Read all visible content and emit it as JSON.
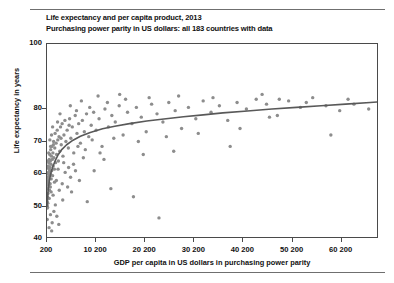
{
  "chart_data": {
    "type": "scatter",
    "title": "Life expectancy and per capita product, 2013",
    "subtitle": "Purchasing power parity in US dollars: all 183 countries with data",
    "xlabel": "GDP per capita in US dollars in purchasing power parity",
    "ylabel": "Life expectancy in years",
    "xlim": [
      200,
      67800
    ],
    "ylim": [
      40,
      100
    ],
    "grid": false,
    "legend": null,
    "n_countries": 183,
    "point_color": "#8d8d8d",
    "trend_color": "#595959",
    "axis_color": "#4a4a4a",
    "xticks": [
      {
        "value": 200,
        "label": "200"
      },
      {
        "value": 10200,
        "label": "10 200"
      },
      {
        "value": 20200,
        "label": "20 200"
      },
      {
        "value": 30200,
        "label": "30 200"
      },
      {
        "value": 40200,
        "label": "40 200"
      },
      {
        "value": 50200,
        "label": "50 200"
      },
      {
        "value": 60200,
        "label": "60 200"
      }
    ],
    "yticks": [
      {
        "value": 100,
        "label": "100"
      },
      {
        "value": 80,
        "label": "80"
      },
      {
        "value": 70,
        "label": "70"
      },
      {
        "value": 60,
        "label": "60"
      },
      {
        "value": 50,
        "label": "50"
      },
      {
        "value": 40,
        "label": "40"
      }
    ],
    "trend_line": {
      "description": "logarithmic best fit of life expectancy versus GDP per capita",
      "points": [
        [
          200,
          50.0
        ],
        [
          400,
          54.5
        ],
        [
          700,
          58.2
        ],
        [
          1000,
          60.4
        ],
        [
          1400,
          62.3
        ],
        [
          1900,
          64.2
        ],
        [
          2500,
          66.0
        ],
        [
          3200,
          67.5
        ],
        [
          4200,
          69.0
        ],
        [
          5500,
          70.4
        ],
        [
          7000,
          71.6
        ],
        [
          9000,
          72.8
        ],
        [
          11500,
          73.9
        ],
        [
          14000,
          74.7
        ],
        [
          17000,
          75.5
        ],
        [
          20500,
          76.3
        ],
        [
          24000,
          76.9
        ],
        [
          28000,
          77.6
        ],
        [
          32000,
          78.2
        ],
        [
          36000,
          78.8
        ],
        [
          41000,
          79.4
        ],
        [
          46000,
          80.0
        ],
        [
          51000,
          80.5
        ],
        [
          56000,
          81.0
        ],
        [
          61000,
          81.5
        ],
        [
          66000,
          82.0
        ],
        [
          67800,
          82.2
        ]
      ]
    },
    "points": [
      [
        220,
        49.5
      ],
      [
        230,
        51.5
      ],
      [
        250,
        50.2
      ],
      [
        280,
        53.0
      ],
      [
        300,
        49.8
      ],
      [
        330,
        55.5
      ],
      [
        350,
        51.0
      ],
      [
        380,
        57.5
      ],
      [
        400,
        54.0
      ],
      [
        420,
        59.0
      ],
      [
        450,
        58.0
      ],
      [
        470,
        62.5
      ],
      [
        500,
        56.5
      ],
      [
        520,
        60.5
      ],
      [
        560,
        63.5
      ],
      [
        600,
        58.5
      ],
      [
        630,
        61.5
      ],
      [
        660,
        64.5
      ],
      [
        700,
        55.0
      ],
      [
        720,
        59.5
      ],
      [
        760,
        66.0
      ],
      [
        800,
        62.0
      ],
      [
        840,
        57.0
      ],
      [
        880,
        64.0
      ],
      [
        920,
        60.0
      ],
      [
        960,
        67.5
      ],
      [
        1000,
        63.0
      ],
      [
        1050,
        58.5
      ],
      [
        1100,
        65.5
      ],
      [
        1150,
        61.0
      ],
      [
        1200,
        68.5
      ],
      [
        1280,
        64.5
      ],
      [
        1340,
        59.5
      ],
      [
        1400,
        66.5
      ],
      [
        1460,
        62.5
      ],
      [
        1540,
        70.0
      ],
      [
        1600,
        65.0
      ],
      [
        1700,
        61.5
      ],
      [
        1780,
        68.0
      ],
      [
        1850,
        72.5
      ],
      [
        1950,
        63.5
      ],
      [
        2050,
        69.5
      ],
      [
        2150,
        66.0
      ],
      [
        2280,
        73.5
      ],
      [
        2400,
        70.5
      ],
      [
        2520,
        64.0
      ],
      [
        2650,
        71.5
      ],
      [
        2800,
        67.0
      ],
      [
        2950,
        74.5
      ],
      [
        3100,
        69.0
      ],
      [
        3280,
        75.5
      ],
      [
        3450,
        65.5
      ],
      [
        3650,
        72.0
      ],
      [
        3850,
        76.5
      ],
      [
        4050,
        70.0
      ],
      [
        4300,
        73.5
      ],
      [
        4550,
        68.0
      ],
      [
        4800,
        77.0
      ],
      [
        5050,
        71.0
      ],
      [
        5350,
        74.5
      ],
      [
        5650,
        66.5
      ],
      [
        5950,
        78.0
      ],
      [
        6300,
        72.5
      ],
      [
        6650,
        75.5
      ],
      [
        7000,
        69.5
      ],
      [
        7400,
        76.5
      ],
      [
        7800,
        73.0
      ],
      [
        8250,
        78.5
      ],
      [
        8700,
        71.5
      ],
      [
        9200,
        75.0
      ],
      [
        9700,
        79.0
      ],
      [
        10200,
        73.5
      ],
      [
        10800,
        77.0
      ],
      [
        11400,
        68.5
      ],
      [
        12000,
        80.0
      ],
      [
        12700,
        74.5
      ],
      [
        13400,
        78.0
      ],
      [
        14100,
        76.0
      ],
      [
        14900,
        81.0
      ],
      [
        15700,
        72.0
      ],
      [
        16600,
        79.0
      ],
      [
        17500,
        75.5
      ],
      [
        18400,
        80.5
      ],
      [
        19400,
        77.5
      ],
      [
        20400,
        73.0
      ],
      [
        21500,
        81.5
      ],
      [
        22600,
        78.5
      ],
      [
        23800,
        76.0
      ],
      [
        25000,
        82.0
      ],
      [
        26300,
        79.5
      ],
      [
        27600,
        74.0
      ],
      [
        29000,
        80.5
      ],
      [
        30500,
        77.0
      ],
      [
        32000,
        82.5
      ],
      [
        33600,
        79.0
      ],
      [
        35300,
        81.0
      ],
      [
        37000,
        76.5
      ],
      [
        38900,
        82.0
      ],
      [
        40800,
        80.0
      ],
      [
        42800,
        83.0
      ],
      [
        44900,
        81.5
      ],
      [
        47100,
        78.0
      ],
      [
        49400,
        82.5
      ],
      [
        51800,
        80.5
      ],
      [
        54300,
        83.5
      ],
      [
        57000,
        81.0
      ],
      [
        59800,
        79.5
      ],
      [
        62700,
        81.5
      ],
      [
        65700,
        80.0
      ],
      [
        1250,
        45.0
      ],
      [
        2200,
        47.0
      ],
      [
        3400,
        52.0
      ],
      [
        5200,
        54.5
      ],
      [
        8400,
        51.5
      ],
      [
        13200,
        55.5
      ],
      [
        17800,
        53.0
      ],
      [
        23000,
        46.5
      ],
      [
        1600,
        48.5
      ],
      [
        900,
        47.5
      ],
      [
        650,
        52.5
      ],
      [
        1900,
        50.5
      ],
      [
        4400,
        56.0
      ],
      [
        6800,
        58.0
      ],
      [
        9800,
        61.0
      ],
      [
        2700,
        55.0
      ],
      [
        3900,
        60.5
      ],
      [
        5600,
        63.0
      ],
      [
        7600,
        65.0
      ],
      [
        11000,
        66.5
      ],
      [
        780,
        70.5
      ],
      [
        1120,
        72.0
      ],
      [
        1500,
        69.0
      ],
      [
        2350,
        76.0
      ],
      [
        3050,
        71.0
      ],
      [
        4700,
        75.0
      ],
      [
        6200,
        79.5
      ],
      [
        8900,
        80.5
      ],
      [
        12500,
        82.0
      ],
      [
        16200,
        83.0
      ],
      [
        550,
        66.5
      ],
      [
        940,
        68.5
      ],
      [
        1340,
        74.5
      ],
      [
        2850,
        78.5
      ],
      [
        4950,
        81.0
      ],
      [
        7200,
        82.5
      ],
      [
        10600,
        84.0
      ],
      [
        15000,
        84.5
      ],
      [
        21000,
        83.5
      ],
      [
        27000,
        84.0
      ],
      [
        34000,
        83.5
      ],
      [
        44000,
        84.5
      ],
      [
        47500,
        83.0
      ],
      [
        53000,
        82.0
      ],
      [
        61500,
        83.0
      ],
      [
        320,
        62.0
      ],
      [
        480,
        64.0
      ],
      [
        880,
        56.0
      ],
      [
        1720,
        57.5
      ],
      [
        2450,
        61.5
      ],
      [
        3600,
        63.5
      ],
      [
        5000,
        59.0
      ],
      [
        6500,
        68.5
      ],
      [
        9400,
        70.5
      ],
      [
        13800,
        71.0
      ],
      [
        18800,
        70.0
      ],
      [
        24500,
        71.5
      ],
      [
        31000,
        72.5
      ],
      [
        39500,
        74.0
      ],
      [
        45500,
        77.5
      ],
      [
        260,
        57.0
      ],
      [
        410,
        60.0
      ],
      [
        740,
        61.0
      ],
      [
        1040,
        54.5
      ],
      [
        1440,
        53.5
      ],
      [
        2100,
        58.0
      ],
      [
        3300,
        57.0
      ],
      [
        4600,
        62.0
      ],
      [
        6000,
        61.0
      ],
      [
        8000,
        67.5
      ],
      [
        11800,
        64.5
      ],
      [
        19800,
        66.0
      ],
      [
        26000,
        67.0
      ],
      [
        37500,
        68.5
      ],
      [
        58000,
        72.0
      ],
      [
        240,
        46.0
      ],
      [
        2600,
        44.5
      ],
      [
        620,
        43.5
      ],
      [
        1150,
        42.5
      ]
    ]
  }
}
